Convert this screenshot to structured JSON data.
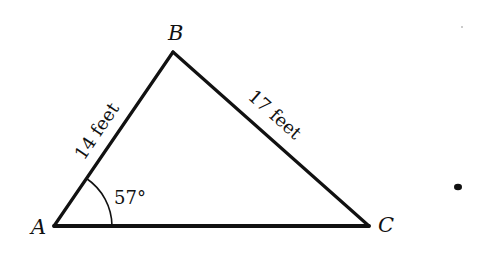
{
  "diagram": {
    "type": "triangle",
    "vertices": {
      "A": {
        "label": "A"
      },
      "B": {
        "label": "B"
      },
      "C": {
        "label": "C"
      }
    },
    "sides": {
      "AB": {
        "label": "14 feet"
      },
      "BC": {
        "label": "17 feet"
      }
    },
    "angles": {
      "A": {
        "label": "57°"
      }
    },
    "colors": {
      "line": "#111111",
      "background": "#ffffff"
    }
  }
}
